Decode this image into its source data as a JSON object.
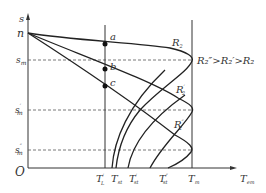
{
  "axes": {
    "y_label": "s",
    "x_label": "T",
    "x_label_sub": "em",
    "origin": "O"
  },
  "y_ticks": [
    {
      "id": "n",
      "label": "n",
      "sub": "",
      "sup": ""
    },
    {
      "id": "sm",
      "label": "s",
      "sub": "m",
      "sup": ""
    },
    {
      "id": "sm1",
      "label": "s",
      "sub": "m",
      "sup": "′"
    },
    {
      "id": "sm2",
      "label": "s",
      "sub": "m",
      "sup": "″"
    }
  ],
  "x_ticks": [
    {
      "id": "TL1",
      "label": "T",
      "sub": "L",
      "sup": "′"
    },
    {
      "id": "Tst",
      "label": "T",
      "sub": "st",
      "sup": ""
    },
    {
      "id": "Tst1",
      "label": "T",
      "sub": "st",
      "sup": "′"
    },
    {
      "id": "Tst2",
      "label": "T",
      "sub": "st",
      "sup": "″"
    },
    {
      "id": "Tm",
      "label": "T",
      "sub": "m",
      "sup": ""
    }
  ],
  "points": [
    {
      "id": "a",
      "label": "a"
    },
    {
      "id": "b",
      "label": "b"
    },
    {
      "id": "c",
      "label": "c"
    }
  ],
  "curves": [
    {
      "id": "R2",
      "label": "R",
      "sub": "2",
      "sup": ""
    },
    {
      "id": "R2p",
      "label": "R",
      "sub": "2",
      "sup": "′"
    },
    {
      "id": "R2pp",
      "label": "R",
      "sub": "2",
      "sup": "″"
    }
  ],
  "relation": "R₂″>R₂′>R₂",
  "colors": {
    "line": "#333333",
    "dashed": "#555555",
    "background": "#ffffff"
  }
}
